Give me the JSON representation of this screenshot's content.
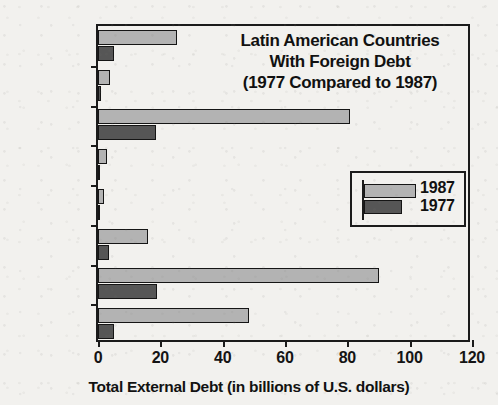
{
  "chart_data": {
    "type": "bar",
    "orientation": "horizontal",
    "title": "Latin American Countries\nWith Foreign Debt\n(1977 Compared to 1987)",
    "title_lines": [
      "Latin American Countries",
      "With Foreign Debt",
      "(1977 Compared to 1987)"
    ],
    "xlabel": "Total External Debt (in billions of U.S. dollars)",
    "ylabel": "",
    "xlim": [
      0,
      120
    ],
    "xticks": [
      0,
      20,
      40,
      60,
      80,
      100,
      120
    ],
    "xtick_labels": [
      "0",
      "20",
      "40",
      "60",
      "80",
      "100",
      "120"
    ],
    "grid": false,
    "legend_position": "center-right",
    "categories": [
      "Venezuela",
      "Jamaica",
      "Mexico",
      "Honduras",
      "Guatemala",
      "Chile",
      "Brazil",
      "Argentina"
    ],
    "series": [
      {
        "name": "1987",
        "color": "#b3b3b3",
        "values": [
          25.5,
          4,
          81,
          3,
          2,
          16,
          90,
          48.5
        ]
      },
      {
        "name": "1977",
        "color": "#565656",
        "values": [
          5,
          1,
          18.5,
          0.8,
          0.6,
          3.5,
          19,
          5
        ]
      }
    ]
  },
  "legend": {
    "entries": [
      {
        "label": "1987",
        "color": "#b3b3b3"
      },
      {
        "label": "1977",
        "color": "#565656"
      }
    ]
  },
  "colors": {
    "background": "#f2f1ee",
    "axis": "#1b1b1b",
    "text": "#111111",
    "series_1987": "#b3b3b3",
    "series_1977": "#565656"
  }
}
